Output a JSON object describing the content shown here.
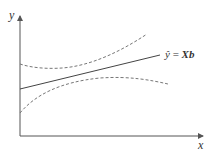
{
  "diagram": {
    "type": "regression-confidence-band",
    "axes": {
      "x_label": "x",
      "y_label": "y"
    },
    "fit_line": {
      "label": "ŷ = Xb",
      "label_hat": "ŷ",
      "label_eq": " = ",
      "label_rhs": "Xb"
    },
    "bands": {
      "upper": "upper confidence band (dashed)",
      "lower": "lower confidence band (dashed)"
    },
    "colors": {
      "axis": "#555555",
      "line": "#444444",
      "dashed": "#777777"
    }
  }
}
